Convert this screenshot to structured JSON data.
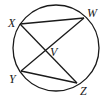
{
  "diagram": {
    "type": "circle-with-chords",
    "circle": {
      "cx": 56,
      "cy": 48,
      "r": 43
    },
    "points": {
      "X": {
        "x": 20,
        "y": 24,
        "label": "X",
        "lx": 8,
        "ly": 27
      },
      "W": {
        "x": 84,
        "y": 18,
        "label": "W",
        "lx": 87,
        "ly": 17
      },
      "Y": {
        "x": 21,
        "y": 71,
        "label": "Y",
        "lx": 9,
        "ly": 83
      },
      "Z": {
        "x": 77,
        "y": 83,
        "label": "Z",
        "lx": 80,
        "ly": 95
      },
      "V": {
        "x": 45,
        "y": 51,
        "label": "V",
        "lx": 50,
        "ly": 56
      }
    },
    "segments": [
      {
        "from": "X",
        "to": "W"
      },
      {
        "from": "Y",
        "to": "Z"
      },
      {
        "from": "X",
        "to": "Z"
      },
      {
        "from": "Y",
        "to": "W"
      }
    ],
    "stroke_color": "#1a1a1a"
  }
}
